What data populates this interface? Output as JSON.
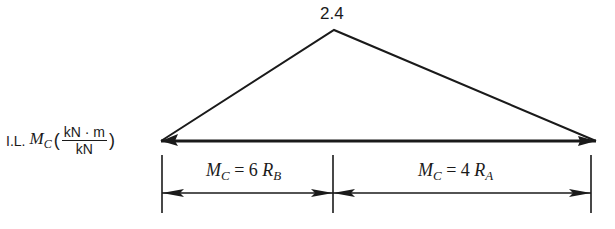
{
  "diagram": {
    "apex_value": "2.4",
    "il_label": {
      "prefix": "I.L.",
      "symbol": "M",
      "subscript": "C",
      "unit_numerator": "kN · m",
      "unit_denominator": "kN"
    },
    "segments": [
      {
        "symbol": "M",
        "sub": "C",
        "eq": " = 6",
        "r": "R",
        "rsub": "B"
      },
      {
        "symbol": "M",
        "sub": "C",
        "eq": " = 4",
        "r": "R",
        "rsub": "A"
      }
    ],
    "geometry": {
      "baseline_y": 141,
      "left_x": 161,
      "right_x": 596,
      "apex_x": 334,
      "apex_y": 30
    },
    "colors": {
      "line": "#1a1a1a",
      "background": "#ffffff"
    }
  }
}
